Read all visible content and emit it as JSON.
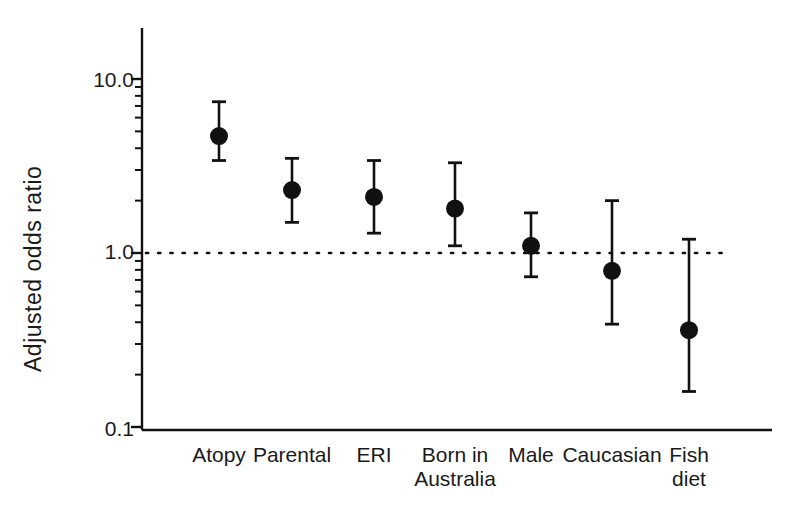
{
  "chart_data": {
    "type": "scatter",
    "title": "",
    "xlabel": "",
    "ylabel": "Adjusted odds ratio",
    "yscale": "log",
    "ylim": [
      0.1,
      14.0
    ],
    "ytick_labels": [
      "10.0",
      "1.0",
      "0.1"
    ],
    "ytick_values": [
      10.0,
      1.0,
      0.1
    ],
    "grid": false,
    "legend": "none",
    "reference_line": {
      "value": 1.0,
      "style": "dotted",
      "label": ""
    },
    "categories": [
      "Atopy",
      "Parental",
      "ERI",
      "Born in\nAustralia",
      "Male",
      "Caucasian",
      "Fish\ndiet"
    ],
    "category_lines": [
      [
        "Atopy"
      ],
      [
        "Parental"
      ],
      [
        "ERI"
      ],
      [
        "Born in",
        "Australia"
      ],
      [
        "Male"
      ],
      [
        "Caucasian"
      ],
      [
        "Fish",
        "diet"
      ]
    ],
    "series": [
      {
        "name": "Adjusted odds ratio",
        "values": [
          4.7,
          2.3,
          2.1,
          1.8,
          1.1,
          0.79,
          0.36
        ],
        "ci_lower": [
          3.4,
          1.5,
          1.3,
          1.1,
          0.73,
          0.39,
          0.16
        ],
        "ci_upper": [
          7.4,
          3.5,
          3.4,
          3.3,
          1.7,
          2.0,
          1.2
        ]
      }
    ]
  },
  "style": {
    "ink": "#111111",
    "background": "#ffffff",
    "marker_radius_px": 9,
    "cap_half_width_px": 7
  }
}
